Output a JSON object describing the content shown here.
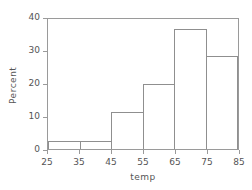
{
  "chart_data": {
    "type": "bar",
    "title": "",
    "subtitle": "",
    "xlabel": "temp",
    "ylabel": "Percent",
    "categories": [
      "25-35",
      "35-45",
      "45-55",
      "55-65",
      "65-75",
      "75-85"
    ],
    "bin_edges": [
      25,
      35,
      45,
      55,
      65,
      75,
      85
    ],
    "values": [
      2.4,
      2.4,
      11.3,
      19.8,
      36.5,
      28.3
    ],
    "xlim": [
      25,
      85
    ],
    "ylim": [
      0,
      40
    ],
    "xticks": [
      25,
      35,
      45,
      55,
      65,
      75,
      85
    ],
    "yticks": [
      0,
      10,
      20,
      30,
      40
    ],
    "xtick_labels": [
      "25",
      "35",
      "45",
      "55",
      "65",
      "75",
      "85"
    ],
    "ytick_labels": [
      "0",
      "10",
      "20",
      "30",
      "40"
    ],
    "grid": false,
    "legend": null,
    "legend_position": "none",
    "annotations": [],
    "colors": {
      "background": "#ffffff",
      "bar_fill": "transparent",
      "bar_edge": "#8f8f8f",
      "axis_line": "#9a9a9a",
      "tick_text": "#555555"
    }
  }
}
